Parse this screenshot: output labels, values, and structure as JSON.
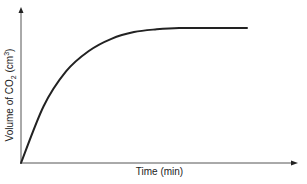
{
  "chart_data": {
    "type": "line",
    "title": "",
    "xlabel": "Time (min)",
    "ylabel": "Volume of CO2 (cm3)",
    "ylabel_parts": {
      "pre": "Volume of CO",
      "sub": "2",
      "mid": " (cm",
      "sup": "3",
      "post": ")"
    },
    "x_ticks": [],
    "y_ticks": [],
    "grid": false,
    "legend": null,
    "series": [
      {
        "name": "CO2 volume",
        "description": "Rises steeply from origin, then levels off to a plateau",
        "x": [
          0,
          0.1,
          0.2,
          0.3,
          0.4,
          0.5,
          0.6,
          0.7,
          0.8,
          1.0
        ],
        "y": [
          0,
          0.42,
          0.68,
          0.83,
          0.92,
          0.97,
          0.99,
          1.0,
          1.0,
          1.0
        ]
      }
    ],
    "xlim": [
      0,
      1
    ],
    "ylim": [
      0,
      1.15
    ],
    "color": "#222222"
  }
}
